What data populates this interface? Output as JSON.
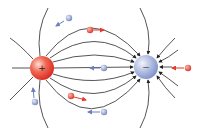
{
  "diagram": {
    "type": "electric-dipole-field-lines",
    "colors": {
      "positive": "#e8403a",
      "negative": "#8fa3d6",
      "field_line": "#222222",
      "background": "#ffffff"
    },
    "charges": [
      {
        "name": "positive-charge",
        "sign": "+",
        "x": 42,
        "y": 68,
        "r": 12
      },
      {
        "name": "negative-charge",
        "sign": "−",
        "x": 146,
        "y": 67,
        "r": 12
      }
    ],
    "test_charges": [
      {
        "sign": "−",
        "color": "blue",
        "x": 69,
        "y": 18,
        "direction": "toward positive"
      },
      {
        "sign": "+",
        "color": "red",
        "x": 90,
        "y": 30,
        "direction": "right"
      },
      {
        "sign": "−",
        "color": "blue",
        "x": 104,
        "y": 68,
        "direction": "left"
      },
      {
        "sign": "+",
        "color": "red",
        "x": 188,
        "y": 68,
        "direction": "left"
      },
      {
        "sign": "−",
        "color": "blue",
        "x": 35,
        "y": 102,
        "direction": "up"
      },
      {
        "sign": "+",
        "color": "red",
        "x": 71,
        "y": 96,
        "direction": "right"
      },
      {
        "sign": "−",
        "color": "blue",
        "x": 104,
        "y": 112,
        "direction": "left"
      }
    ]
  }
}
